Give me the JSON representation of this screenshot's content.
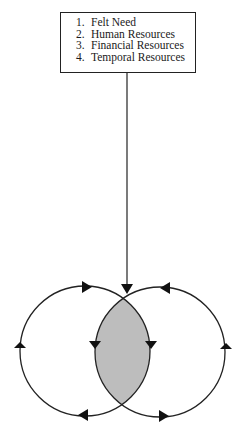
{
  "box": {
    "items": [
      {
        "num": "1.",
        "label": "Felt Need"
      },
      {
        "num": "2.",
        "label": "Human Resources"
      },
      {
        "num": "3.",
        "label": "Financial Resources"
      },
      {
        "num": "4.",
        "label": "Temporal Resources"
      }
    ]
  },
  "diagram": {
    "left_circle": {
      "cx": 85,
      "cy": 351,
      "r": 65,
      "direction": "clockwise"
    },
    "right_circle": {
      "cx": 160,
      "cy": 352,
      "r": 65,
      "direction": "counter-clockwise"
    },
    "overlap_fill": "#bdbdbd",
    "stroke": "#222222"
  }
}
